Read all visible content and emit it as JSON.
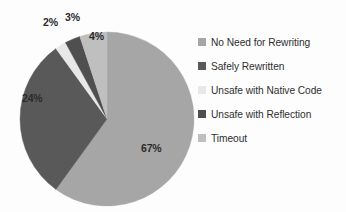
{
  "chart_data": {
    "type": "pie",
    "title": "",
    "categories": [
      "No Need for Rewriting",
      "Safely Rewritten",
      "Unsafe with Native Code",
      "Unsafe with Reflection",
      "Timeout"
    ],
    "values": [
      67,
      24,
      2,
      3,
      4
    ],
    "value_labels": [
      "67%",
      "24%",
      "2%",
      "3%",
      "4%"
    ],
    "colors": [
      "#a6a6a6",
      "#595959",
      "#e8e8e8",
      "#4f4f4f",
      "#bfbfbf"
    ],
    "legend_position": "right",
    "start_angle_deg": 0,
    "direction": "clockwise",
    "grid": false,
    "xlabel": "",
    "ylabel": ""
  },
  "legend": {
    "items": [
      {
        "label": "No Need for Rewriting",
        "color": "#a6a6a6"
      },
      {
        "label": "Safely Rewritten",
        "color": "#595959"
      },
      {
        "label": "Unsafe with Native Code",
        "color": "#e8e8e8"
      },
      {
        "label": "Unsafe with Reflection",
        "color": "#4f4f4f"
      },
      {
        "label": "Timeout",
        "color": "#bfbfbf"
      }
    ]
  },
  "slice_labels": [
    {
      "text": "67%",
      "x": 141,
      "y": 142
    },
    {
      "text": "24%",
      "x": 22,
      "y": 92
    },
    {
      "text": "2%",
      "x": 43,
      "y": 16
    },
    {
      "text": "3%",
      "x": 65,
      "y": 11
    },
    {
      "text": "4%",
      "x": 89,
      "y": 30
    }
  ]
}
